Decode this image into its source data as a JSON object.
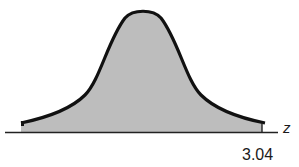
{
  "figure": {
    "type": "normal-distribution-curve",
    "axis_label": "z",
    "tick_label": "3.04",
    "shaded_region": "left of z = 3.04",
    "colors": {
      "curve": "#111111",
      "fill": "#bdbdbd",
      "axis": "#222222",
      "background": "#ffffff"
    }
  }
}
